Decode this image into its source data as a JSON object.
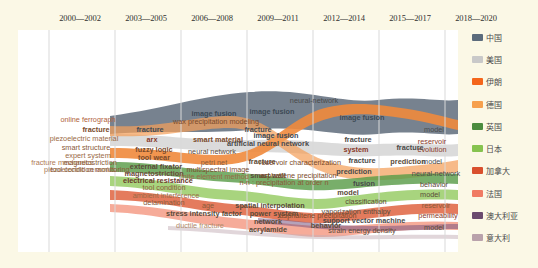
{
  "chart_data": {
    "type": "area",
    "title": "",
    "subtitle": "",
    "xlabel": "",
    "ylabel": "",
    "grid": false,
    "legend_position": "right",
    "categories": [
      "2000—2002",
      "2003—2005",
      "2006—2008",
      "2009—2011",
      "2012—2014",
      "2015—2017",
      "2018—2020"
    ],
    "series": [
      {
        "name": "中国",
        "color": "#5b6b7c"
      },
      {
        "name": "美国",
        "color": "#c9c9c9"
      },
      {
        "name": "伊朗",
        "color": "#f4661b"
      },
      {
        "name": "德国",
        "color": "#f6a04d"
      },
      {
        "name": "英国",
        "color": "#4c8c3f"
      },
      {
        "name": "日本",
        "color": "#86c34f"
      },
      {
        "name": "加拿大",
        "color": "#d9502e"
      },
      {
        "name": "法国",
        "color": "#f07b63"
      },
      {
        "name": "澳大利亚",
        "color": "#6b4a6e"
      },
      {
        "name": "意大利",
        "color": "#b9a2ab"
      }
    ]
  },
  "periods": [
    {
      "label": "2000—2002",
      "x": 62
    },
    {
      "label": "2003—2005",
      "x": 128
    },
    {
      "label": "2006—2008",
      "x": 194
    },
    {
      "label": "2009—2011",
      "x": 260
    },
    {
      "label": "2012—2014",
      "x": 326
    },
    {
      "label": "2015—2017",
      "x": 392
    },
    {
      "label": "2018—2020",
      "x": 458
    }
  ],
  "keywords": [
    {
      "text": "online ferrograph",
      "x": 70,
      "y": 90,
      "color": "#b0623a",
      "weight": 400
    },
    {
      "text": "fracture",
      "x": 78,
      "y": 100,
      "color": "#7a4a2a",
      "weight": 700
    },
    {
      "text": "piezoelectric material",
      "x": 66,
      "y": 109,
      "color": "#9a6a45",
      "weight": 400
    },
    {
      "text": "smart structure",
      "x": 68,
      "y": 118,
      "color": "#8a5a38",
      "weight": 400
    },
    {
      "text": "expert system",
      "x": 70,
      "y": 126,
      "color": "#9a6a45",
      "weight": 400
    },
    {
      "text": "fracture mechanics",
      "x": 44,
      "y": 133,
      "color": "#b07a55",
      "weight": 400
    },
    {
      "text": "magnetostriction",
      "x": 72,
      "y": 133,
      "color": "#8a5a38",
      "weight": 400
    },
    {
      "text": "piezoelectric ceramics",
      "x": 62,
      "y": 140,
      "color": "#a87a58",
      "weight": 400
    },
    {
      "text": "tool condition monitoring",
      "x": 72,
      "y": 140,
      "color": "#8a5a38",
      "weight": 400
    },
    {
      "text": "fracture",
      "x": 132,
      "y": 100,
      "color": "#3d4a55",
      "weight": 700
    },
    {
      "text": "arx",
      "x": 134,
      "y": 110,
      "color": "#8a3a2a",
      "weight": 700
    },
    {
      "text": "wax precipitation modeling",
      "x": 198,
      "y": 92,
      "color": "#7a4a2a",
      "weight": 400
    },
    {
      "text": "fuzzy logic",
      "x": 136,
      "y": 120,
      "color": "#7a4a2a",
      "weight": 700
    },
    {
      "text": "tool wear",
      "x": 136,
      "y": 128,
      "color": "#7a4a2a",
      "weight": 700
    },
    {
      "text": "external fixator",
      "x": 138,
      "y": 137,
      "color": "#5a4a38",
      "weight": 700
    },
    {
      "text": "magnetostriction",
      "x": 136,
      "y": 144,
      "color": "#6a4a38",
      "weight": 700
    },
    {
      "text": "electrical resistance",
      "x": 140,
      "y": 151,
      "color": "#6a3a2a",
      "weight": 700
    },
    {
      "text": "tool condition",
      "x": 146,
      "y": 158,
      "color": "#8a5a38",
      "weight": 400
    },
    {
      "text": "ambient interference",
      "x": 148,
      "y": 166,
      "color": "#9a6a45",
      "weight": 400
    },
    {
      "text": "delamination",
      "x": 146,
      "y": 173,
      "color": "#8a5a38",
      "weight": 400
    },
    {
      "text": "image fusion",
      "x": 196,
      "y": 84,
      "color": "#3d4a55",
      "weight": 700
    },
    {
      "text": "image fusion",
      "x": 254,
      "y": 82,
      "color": "#3d4a55",
      "weight": 700
    },
    {
      "text": "smart material",
      "x": 200,
      "y": 110,
      "color": "#7a4a2a",
      "weight": 700
    },
    {
      "text": "neural network",
      "x": 194,
      "y": 122,
      "color": "#5a4a38",
      "weight": 400
    },
    {
      "text": "petri net",
      "x": 196,
      "y": 133,
      "color": "#8a5a38",
      "weight": 400
    },
    {
      "text": "multispectral image",
      "x": 200,
      "y": 140,
      "color": "#7a4a2a",
      "weight": 400
    },
    {
      "text": "finite element method",
      "x": 196,
      "y": 147,
      "color": "#9a6a45",
      "weight": 400
    },
    {
      "text": "age",
      "x": 190,
      "y": 176,
      "color": "#8a5a38",
      "weight": 400
    },
    {
      "text": "stress intensity factor",
      "x": 186,
      "y": 184,
      "color": "#5a4a38",
      "weight": 700
    },
    {
      "text": "ductile fracture",
      "x": 182,
      "y": 196,
      "color": "#b08a6a",
      "weight": 400
    },
    {
      "text": "neural-network",
      "x": 296,
      "y": 71,
      "color": "#4a4a4a",
      "weight": 400
    },
    {
      "text": "image fusion",
      "x": 258,
      "y": 106,
      "color": "#3d4a55",
      "weight": 700
    },
    {
      "text": "fracture",
      "x": 240,
      "y": 100,
      "color": "#3d4a55",
      "weight": 700
    },
    {
      "text": "artificial neural network",
      "x": 250,
      "y": 114,
      "color": "#4a4a4a",
      "weight": 700
    },
    {
      "text": "fracture",
      "x": 244,
      "y": 132,
      "color": "#5a4a38",
      "weight": 700
    },
    {
      "text": "reservoir characterization",
      "x": 282,
      "y": 133,
      "color": "#7a4a2a",
      "weight": 400
    },
    {
      "text": "smart wall",
      "x": 250,
      "y": 146,
      "color": "#5a4a38",
      "weight": 700
    },
    {
      "text": "asphaltene precipitation",
      "x": 280,
      "y": 146,
      "color": "#7a4a2a",
      "weight": 400
    },
    {
      "text": "n-n : precipitation at order n",
      "x": 266,
      "y": 153,
      "color": "#8a5a38",
      "weight": 400
    },
    {
      "text": "spatial interpolation",
      "x": 252,
      "y": 176,
      "color": "#5a4a38",
      "weight": 700
    },
    {
      "text": "power system",
      "x": 256,
      "y": 184,
      "color": "#5a4a38",
      "weight": 700
    },
    {
      "text": "network",
      "x": 250,
      "y": 192,
      "color": "#5a4a38",
      "weight": 700
    },
    {
      "text": "acrylamide",
      "x": 250,
      "y": 200,
      "color": "#5a4a38",
      "weight": 700
    },
    {
      "text": "image fusion",
      "x": 344,
      "y": 88,
      "color": "#3d4a55",
      "weight": 700
    },
    {
      "text": "fracture",
      "x": 340,
      "y": 110,
      "color": "#4a4a4a",
      "weight": 700
    },
    {
      "text": "system",
      "x": 338,
      "y": 120,
      "color": "#8a3a2a",
      "weight": 700
    },
    {
      "text": "fracture",
      "x": 344,
      "y": 131,
      "color": "#4a4a4a",
      "weight": 700
    },
    {
      "text": "prediction",
      "x": 336,
      "y": 142,
      "color": "#4a4a4a",
      "weight": 700
    },
    {
      "text": "fusion",
      "x": 346,
      "y": 154,
      "color": "#4a4a4a",
      "weight": 700
    },
    {
      "text": "model",
      "x": 330,
      "y": 163,
      "color": "#5a4a38",
      "weight": 700
    },
    {
      "text": "classification",
      "x": 348,
      "y": 172,
      "color": "#5a4a38",
      "weight": 400
    },
    {
      "text": "vaporization enthalpy",
      "x": 338,
      "y": 182,
      "color": "#5a4a38",
      "weight": 400
    },
    {
      "text": "support vector machine",
      "x": 346,
      "y": 191,
      "color": "#4a4a4a",
      "weight": 700
    },
    {
      "text": "strain energy density",
      "x": 344,
      "y": 201,
      "color": "#5a4a38",
      "weight": 400
    },
    {
      "text": "behavior",
      "x": 308,
      "y": 196,
      "color": "#5a4a38",
      "weight": 700
    },
    {
      "text": "asphaltene precipitation",
      "x": 300,
      "y": 186,
      "color": "#7a4a2a",
      "weight": 400
    },
    {
      "text": "model",
      "x": 416,
      "y": 100,
      "color": "#4a4a4a",
      "weight": 400
    },
    {
      "text": "reservoir",
      "x": 414,
      "y": 112,
      "color": "#8a3a2a",
      "weight": 400
    },
    {
      "text": "evolution",
      "x": 414,
      "y": 120,
      "color": "#8a3a2a",
      "weight": 400
    },
    {
      "text": "fracture",
      "x": 392,
      "y": 118,
      "color": "#4a4a4a",
      "weight": 700
    },
    {
      "text": "prediction",
      "x": 390,
      "y": 132,
      "color": "#5a4a38",
      "weight": 700
    },
    {
      "text": "model",
      "x": 414,
      "y": 132,
      "color": "#4a4a4a",
      "weight": 400
    },
    {
      "text": "neural-network",
      "x": 418,
      "y": 144,
      "color": "#4a4a4a",
      "weight": 400
    },
    {
      "text": "behavior",
      "x": 416,
      "y": 155,
      "color": "#5a4a38",
      "weight": 400
    },
    {
      "text": "model",
      "x": 412,
      "y": 165,
      "color": "#5a4a38",
      "weight": 400
    },
    {
      "text": "reservoir",
      "x": 418,
      "y": 176,
      "color": "#8a5a38",
      "weight": 400
    },
    {
      "text": "permeability",
      "x": 420,
      "y": 186,
      "color": "#8a3a2a",
      "weight": 400
    },
    {
      "text": "model",
      "x": 416,
      "y": 198,
      "color": "#5a4a38",
      "weight": 400
    }
  ],
  "legend": {
    "items": [
      {
        "label": "中国",
        "color": "#5b6b7c"
      },
      {
        "label": "美国",
        "color": "#c9c9c9"
      },
      {
        "label": "伊朗",
        "color": "#f4661b"
      },
      {
        "label": "德国",
        "color": "#f6a04d"
      },
      {
        "label": "英国",
        "color": "#4c8c3f"
      },
      {
        "label": "日本",
        "color": "#86c34f"
      },
      {
        "label": "加拿大",
        "color": "#d9502e"
      },
      {
        "label": "法国",
        "color": "#f07b63"
      },
      {
        "label": "澳大利亚",
        "color": "#6b4a6e"
      },
      {
        "label": "意大利",
        "color": "#b9a2ab"
      }
    ]
  }
}
